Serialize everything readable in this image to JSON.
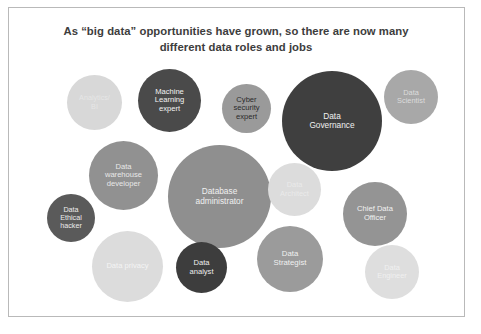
{
  "slide": {
    "title": "As “big data” opportunities have grown, so there are now many different data roles and jobs",
    "background_color": "#ffffff",
    "border_color": "#b9b9b9"
  },
  "chart_data": {
    "type": "bubble",
    "title": "As “big data” opportunities have grown, so there are now many different data roles and jobs",
    "xlabel": "",
    "ylabel": "",
    "legend": "none",
    "grid": false,
    "note": "Grayscale bubble cloud of data job roles; bubble size suggests relative prominence of each role.",
    "categories": [
      "Analytics/ BI",
      "Machine Learning expert",
      "Cyber security expert",
      "Data Governance",
      "Data Scientist",
      "Data warehouse developer",
      "Database administrator",
      "Data Architect",
      "Chief Data Officer",
      "Data Ethical hacker",
      "Data privacy",
      "Data analyst",
      "Data Strategist",
      "Data Engineer"
    ],
    "bubbles": [
      {
        "label": "Analytics/\nBI",
        "x": 67,
        "y": 75,
        "size": 55,
        "fill": "#d8d8d8",
        "text_color": "#e6e6e6",
        "font_size": 7.2
      },
      {
        "label": "Machine\nLearning\nexpert",
        "x": 138,
        "y": 69,
        "size": 63,
        "fill": "#4a4a4a",
        "text_color": "#f2f2f2",
        "font_size": 7.6
      },
      {
        "label": "Cyber\nsecurity\nexpert",
        "x": 222,
        "y": 84,
        "size": 49,
        "fill": "#9a9a9a",
        "text_color": "#2b2b2b",
        "font_size": 7.6
      },
      {
        "label": "Data\nGovernance",
        "x": 282,
        "y": 71,
        "size": 100,
        "fill": "#3f3f3f",
        "text_color": "#f0f0f0",
        "font_size": 8.3
      },
      {
        "label": "Data\nScientist",
        "x": 384,
        "y": 70,
        "size": 54,
        "fill": "#a8a8a8",
        "text_color": "#dcdcdc",
        "font_size": 7.4
      },
      {
        "label": "Data\nwarehouse\ndeveloper",
        "x": 89,
        "y": 141,
        "size": 69,
        "fill": "#919191",
        "text_color": "#e8e8e8",
        "font_size": 7.6
      },
      {
        "label": "Database\nadministrator",
        "x": 168,
        "y": 145,
        "size": 103,
        "fill": "#8f8f8f",
        "text_color": "#f0f0f0",
        "font_size": 8.3
      },
      {
        "label": "Data\nArchitect",
        "x": 268,
        "y": 163,
        "size": 53,
        "fill": "#dcdcdc",
        "text_color": "#eaeaea",
        "font_size": 7.4
      },
      {
        "label": "Chief Data\nOfficer",
        "x": 343,
        "y": 182,
        "size": 64,
        "fill": "#949494",
        "text_color": "#f2f2f2",
        "font_size": 7.6
      },
      {
        "label": "Data\nEthical\nhacker",
        "x": 47,
        "y": 194,
        "size": 48,
        "fill": "#5a5a5a",
        "text_color": "#ececec",
        "font_size": 7.2
      },
      {
        "label": "Data privacy",
        "x": 92,
        "y": 231,
        "size": 71,
        "fill": "#dcdcdc",
        "text_color": "#f4f4f4",
        "font_size": 7.6
      },
      {
        "label": "Data\nanalyst",
        "x": 176,
        "y": 242,
        "size": 51,
        "fill": "#3d3d3d",
        "text_color": "#ededed",
        "font_size": 7.6
      },
      {
        "label": "Data\nStrategist",
        "x": 257,
        "y": 226,
        "size": 66,
        "fill": "#9b9b9b",
        "text_color": "#f0f0f0",
        "font_size": 7.8
      },
      {
        "label": "Data\nEngineer",
        "x": 365,
        "y": 245,
        "size": 54,
        "fill": "#dedede",
        "text_color": "#f0f0f0",
        "font_size": 7.4
      }
    ]
  }
}
